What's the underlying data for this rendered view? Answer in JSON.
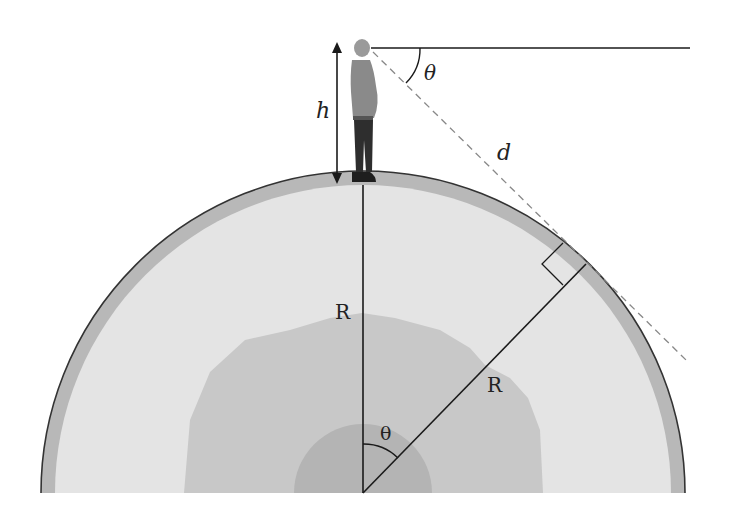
{
  "diagram": {
    "labels": {
      "height": "h",
      "angle_top": "θ",
      "distance": "d",
      "radius_vertical": "R",
      "radius_diagonal": "R",
      "angle_center": "θ"
    },
    "colors": {
      "background": "#ffffff",
      "crust": "#b8b8b8",
      "mantle": "#e3e3e3",
      "outer_core": "#c7c7c7",
      "inner_core": "#b3b3b3",
      "lines": "#1a1a1a",
      "dashed": "#888888"
    },
    "elements": [
      "person-figure",
      "height-arrow",
      "horizontal-line",
      "line-of-sight-dashed",
      "earth-cross-section",
      "radius-vertical",
      "radius-to-tangent-point",
      "right-angle-marker"
    ]
  }
}
